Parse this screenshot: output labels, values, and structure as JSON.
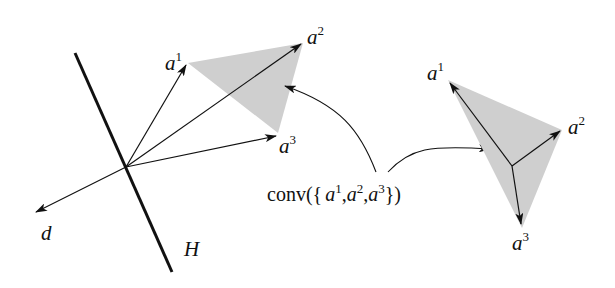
{
  "figure": {
    "left": {
      "hyperplane_label": "H",
      "direction_label": "d",
      "vectors": [
        {
          "base": "a",
          "sup": "1"
        },
        {
          "base": "a",
          "sup": "2"
        },
        {
          "base": "a",
          "sup": "3"
        }
      ]
    },
    "caption": {
      "prefix": "conv({",
      "items": [
        {
          "base": "a",
          "sup": "1"
        },
        {
          "base": "a",
          "sup": "2"
        },
        {
          "base": "a",
          "sup": "3"
        }
      ],
      "suffix": "})"
    },
    "right": {
      "vectors": [
        {
          "base": "a",
          "sup": "1"
        },
        {
          "base": "a",
          "sup": "2"
        },
        {
          "base": "a",
          "sup": "3"
        }
      ]
    },
    "colors": {
      "fill": "#cfcfcf",
      "stroke": "#111111"
    }
  }
}
